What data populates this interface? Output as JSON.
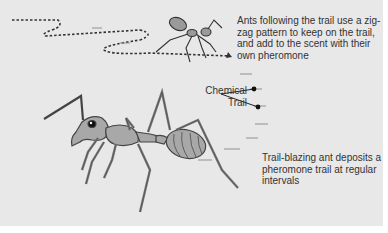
{
  "diagram": {
    "labels": {
      "followers": "Ants  following the trail use a zig-zag pattern to keep on the trail, and add to the scent with their own pheromone",
      "chemical_trail_line1": "Chemical",
      "chemical_trail_line2": "Trail",
      "trail_blazer": "Trail-blazing ant deposits a pheromone trail at regular intervals"
    },
    "figures": [
      {
        "name": "follower-ant",
        "description": "small ant walking along zig-zag dotted path"
      },
      {
        "name": "trail-blazing-ant",
        "description": "large ant depositing pheromone"
      }
    ],
    "colors": {
      "background": "#e8e8e8",
      "ant_fill": "#a8a8a8",
      "ant_outline": "#444444",
      "text": "#333333"
    }
  }
}
